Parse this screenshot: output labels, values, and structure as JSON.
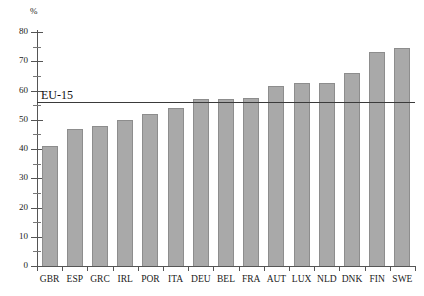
{
  "chart_data": {
    "type": "bar",
    "title": "",
    "subtitle": "",
    "xlabel": "",
    "ylabel": "%",
    "ylim": [
      0,
      80
    ],
    "ytick_step": 10,
    "minor_tick_step": 5,
    "grid": false,
    "legend": "none",
    "categories": [
      "GBR",
      "ESP",
      "GRC",
      "IRL",
      "POR",
      "ITA",
      "DEU",
      "BEL",
      "FRA",
      "AUT",
      "LUX",
      "NLD",
      "DNK",
      "FIN",
      "SWE"
    ],
    "values": [
      41,
      47,
      48,
      50,
      52,
      54,
      57,
      57,
      57.5,
      61.5,
      62.5,
      62.5,
      66,
      73,
      74.5
    ],
    "ytick_labels": [
      "0",
      "10",
      "20",
      "30",
      "40",
      "50",
      "60",
      "70",
      "80"
    ],
    "ytick_values": [
      0,
      10,
      20,
      30,
      40,
      50,
      60,
      70,
      80
    ],
    "annotations": [
      {
        "name": "eu-15-reference-line",
        "label": "EU-15",
        "value": 56,
        "orientation": "horizontal"
      }
    ],
    "bar_fill_color": "#a9a9a9",
    "bar_border_color": "#8d8d8d",
    "axis_color": "#555555",
    "reference_line_color": "#3a3a3a"
  }
}
